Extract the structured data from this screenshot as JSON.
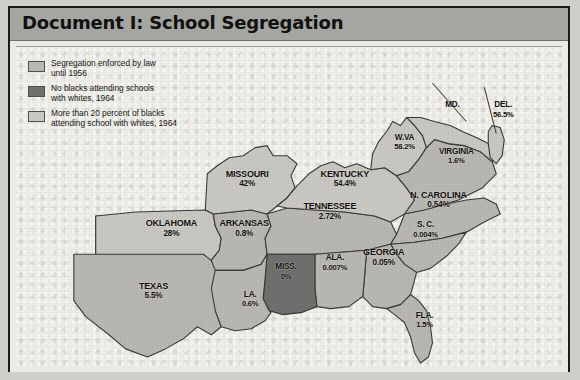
{
  "document": {
    "title": "Document I: School Segregation",
    "frame_color": "#1a1a1a",
    "title_band_color": "#a5a5a1",
    "page_color": "#eceae4"
  },
  "legend": {
    "items": [
      {
        "swatch": "law-swatch",
        "color": "#b9b7b1",
        "line1": "Segregation enforced by law",
        "line2": "until 1956"
      },
      {
        "swatch": "none-swatch",
        "color": "#6f6f6d",
        "line1": "No blacks attending schools",
        "line2": "with whites, 1964"
      },
      {
        "swatch": "more-swatch",
        "color": "#c9c7c1",
        "line1": "More than 20 percent of blacks",
        "line2": "attending school with whites, 1964"
      }
    ]
  },
  "chart_data": {
    "type": "map",
    "title": "Document I: School Segregation",
    "value_label": "Percent of blacks attending school with whites, 1964",
    "categories": [
      "MISSOURI",
      "KENTUCKY",
      "W.VA",
      "VIRGINIA",
      "MD.",
      "DEL.",
      "N. CAROLINA",
      "S. C.",
      "TENNESSEE",
      "ARKANSAS",
      "OKLAHOMA",
      "TEXAS",
      "LA.",
      "MISS.",
      "ALA.",
      "GEORGIA",
      "FLA."
    ],
    "values": [
      42,
      54.4,
      58.2,
      1.6,
      null,
      56.5,
      0.54,
      0.004,
      2.72,
      0.8,
      28,
      5.5,
      0.6,
      0,
      0.007,
      0.05,
      1.5
    ],
    "legend": [
      "Segregation enforced by law until 1956",
      "No blacks attending schools with whites, 1964",
      "More than 20 percent of blacks attending school with whites, 1964"
    ],
    "regions": [
      {
        "name": "MISSOURI",
        "pct": "42%",
        "class": "more",
        "x": 232,
        "y": 131
      },
      {
        "name": "KENTUCKY",
        "pct": "54.4%",
        "class": "more",
        "x": 330,
        "y": 131
      },
      {
        "name": "W.VA",
        "pct": "58.2%",
        "class": "more",
        "x": 390,
        "y": 94
      },
      {
        "name": "VIRGINIA",
        "pct": "1.6%",
        "class": "law",
        "x": 442,
        "y": 108
      },
      {
        "name": "MD.",
        "pct": "",
        "class": "more",
        "x": 438,
        "y": 58
      },
      {
        "name": "DEL.",
        "pct": "56.5%",
        "class": "more",
        "x": 489,
        "y": 62
      },
      {
        "name": "N. CAROLINA",
        "pct": "0.54%",
        "class": "law",
        "x": 424,
        "y": 152
      },
      {
        "name": "S. C.",
        "pct": "0.004%",
        "class": "law",
        "x": 411,
        "y": 181
      },
      {
        "name": "TENNESSEE",
        "pct": "2.72%",
        "class": "law",
        "x": 315,
        "y": 163
      },
      {
        "name": "ARKANSAS",
        "pct": "0.8%",
        "class": "law",
        "x": 229,
        "y": 180
      },
      {
        "name": "OKLAHOMA",
        "pct": "28%",
        "class": "more",
        "x": 156,
        "y": 180
      },
      {
        "name": "TEXAS",
        "pct": "5.5%",
        "class": "law",
        "x": 138,
        "y": 242
      },
      {
        "name": "LA.",
        "pct": "0.6%",
        "class": "law",
        "x": 235,
        "y": 250
      },
      {
        "name": "MISS.",
        "pct": "0%",
        "class": "none",
        "x": 271,
        "y": 223
      },
      {
        "name": "ALA.",
        "pct": "0.007%",
        "class": "law",
        "x": 320,
        "y": 214
      },
      {
        "name": "GEORGIA",
        "pct": "0.05%",
        "class": "law",
        "x": 369,
        "y": 209
      },
      {
        "name": "FLA.",
        "pct": "1.5%",
        "class": "law",
        "x": 410,
        "y": 271
      }
    ],
    "colors": {
      "law": "#b9b7b1",
      "none": "#6f6f6d",
      "more": "#c9c7c1",
      "outline": "#3a3a38",
      "background": "#efede7"
    }
  }
}
